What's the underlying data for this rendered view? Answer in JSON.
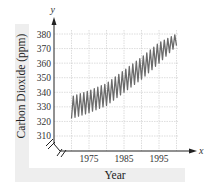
{
  "chart_data": {
    "type": "line",
    "title": "",
    "xlabel": "Year",
    "ylabel": "Carbon Dioxide (ppm)",
    "x_axis_variable": "x",
    "y_axis_variable": "y",
    "x_ticks": [
      1975,
      1985,
      1995
    ],
    "x_tick_labels": [
      "1975",
      "1985",
      "1995"
    ],
    "y_ticks": [
      310,
      320,
      330,
      340,
      350,
      360,
      370,
      380
    ],
    "y_tick_labels": [
      "310",
      "320",
      "330",
      "340",
      "350",
      "360",
      "370",
      "380"
    ],
    "xlim": [
      1965,
      2005
    ],
    "ylim": [
      305,
      385
    ],
    "grid": true,
    "grid_x_step": 5,
    "grid_y_step": 10,
    "axis_break": "y-axis broken near origin (zigzag break marks)",
    "legend": null,
    "series": [
      {
        "name": "Carbon Dioxide (seasonal oscillation)",
        "description": "Oscillating band: one cycle per year, rising from about 322-337 ppm in 1970 to about 372-380 ppm in 2000",
        "x": [
          1970,
          1975,
          1980,
          1985,
          1990,
          1995,
          2000
        ],
        "upper": [
          337,
          341,
          346,
          355,
          364,
          374,
          380
        ],
        "lower": [
          322,
          326,
          331,
          340,
          349,
          360,
          372
        ]
      }
    ],
    "colors": {
      "data": "#6b6b6b",
      "grid": "#cfcfcf",
      "axis": "#222222",
      "label_band": "#eeeeee"
    }
  },
  "labels": {
    "y_var": "y",
    "x_var": "x",
    "ylabel": "Carbon Dioxide (ppm)",
    "xlabel": "Year",
    "y_ticks": [
      "380",
      "370",
      "360",
      "350",
      "340",
      "330",
      "320",
      "310"
    ],
    "x_ticks": [
      "1975",
      "1985",
      "1995"
    ]
  }
}
